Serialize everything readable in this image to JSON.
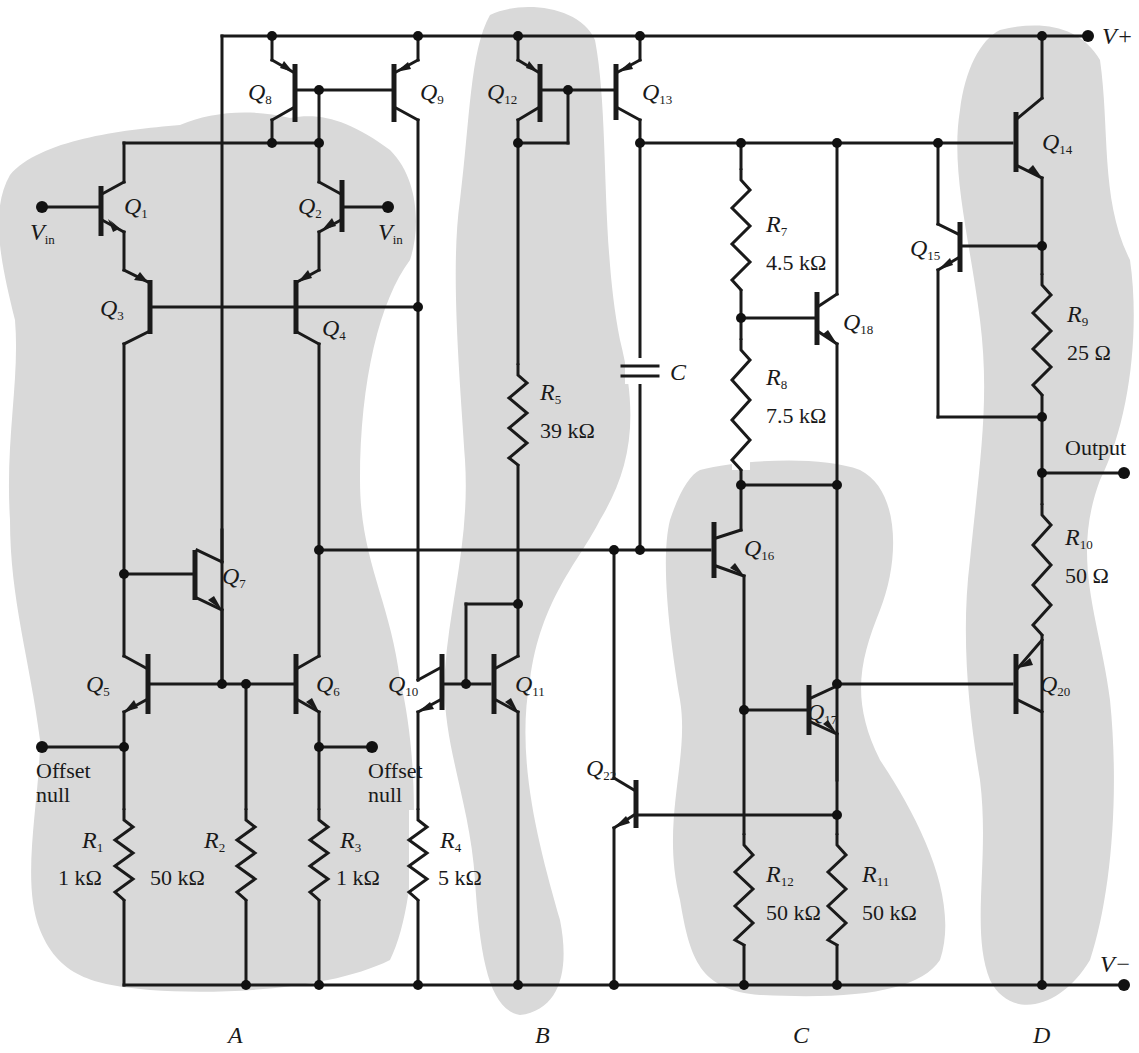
{
  "rails": {
    "vplus": "V+",
    "vminus": "V−"
  },
  "terminals": {
    "vin_left": {
      "main": "V",
      "sub": "in"
    },
    "vin_right": {
      "main": "V",
      "sub": "in"
    },
    "output": "Output",
    "offset_null_left": [
      "Offset",
      "null"
    ],
    "offset_null_right": [
      "Offset",
      "null"
    ]
  },
  "transistors": {
    "Q1": {
      "main": "Q",
      "sub": "1"
    },
    "Q2": {
      "main": "Q",
      "sub": "2"
    },
    "Q3": {
      "main": "Q",
      "sub": "3"
    },
    "Q4": {
      "main": "Q",
      "sub": "4"
    },
    "Q5": {
      "main": "Q",
      "sub": "5"
    },
    "Q6": {
      "main": "Q",
      "sub": "6"
    },
    "Q7": {
      "main": "Q",
      "sub": "7"
    },
    "Q8": {
      "main": "Q",
      "sub": "8"
    },
    "Q9": {
      "main": "Q",
      "sub": "9"
    },
    "Q10": {
      "main": "Q",
      "sub": "10"
    },
    "Q11": {
      "main": "Q",
      "sub": "11"
    },
    "Q12": {
      "main": "Q",
      "sub": "12"
    },
    "Q13": {
      "main": "Q",
      "sub": "13"
    },
    "Q14": {
      "main": "Q",
      "sub": "14"
    },
    "Q15": {
      "main": "Q",
      "sub": "15"
    },
    "Q16": {
      "main": "Q",
      "sub": "16"
    },
    "Q17": {
      "main": "Q",
      "sub": "17"
    },
    "Q18": {
      "main": "Q",
      "sub": "18"
    },
    "Q20": {
      "main": "Q",
      "sub": "20"
    },
    "Q22": {
      "main": "Q",
      "sub": "22"
    }
  },
  "resistors": {
    "R1": {
      "main": "R",
      "sub": "1",
      "value": "1 kΩ"
    },
    "R2": {
      "main": "R",
      "sub": "2",
      "value": "50 kΩ"
    },
    "R3": {
      "main": "R",
      "sub": "3",
      "value": "1 kΩ"
    },
    "R4": {
      "main": "R",
      "sub": "4",
      "value": "5 kΩ"
    },
    "R5": {
      "main": "R",
      "sub": "5",
      "value": "39 kΩ"
    },
    "R7": {
      "main": "R",
      "sub": "7",
      "value": "4.5 kΩ"
    },
    "R8": {
      "main": "R",
      "sub": "8",
      "value": "7.5 kΩ"
    },
    "R9": {
      "main": "R",
      "sub": "9",
      "value": "25 Ω"
    },
    "R10": {
      "main": "R",
      "sub": "10",
      "value": "50 Ω"
    },
    "R11": {
      "main": "R",
      "sub": "11",
      "value": "50 kΩ"
    },
    "R12": {
      "main": "R",
      "sub": "12",
      "value": "50 kΩ"
    }
  },
  "capacitor": {
    "label": "C"
  },
  "regions": {
    "A": "A",
    "B": "B",
    "C": "C",
    "D": "D"
  },
  "colors": {
    "region_fill": "#d9d9d9",
    "ink": "#1a1a1a",
    "background": "#ffffff"
  }
}
